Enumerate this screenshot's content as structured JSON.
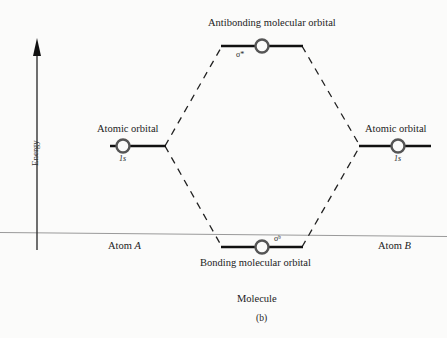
{
  "diagram": {
    "type": "molecular-orbital-energy-level-diagram",
    "axis": {
      "label": "Energy"
    },
    "labels": {
      "antibonding": "Antibonding molecular orbital",
      "bonding": "Bonding molecular orbital",
      "atomic_left": "Atomic orbital",
      "atomic_right": "Atomic orbital",
      "molecule": "Molecule",
      "caption": "(b)"
    },
    "levels": {
      "left_atomic": {
        "orbital": "1s"
      },
      "right_atomic": {
        "orbital": "1s"
      },
      "antibonding": {
        "symbol": "σ*"
      },
      "bonding": {
        "symbol": "σᵇ"
      }
    },
    "atoms": {
      "left": {
        "prefix": "Atom ",
        "name": "A"
      },
      "right": {
        "prefix": "Atom ",
        "name": "B"
      }
    }
  }
}
